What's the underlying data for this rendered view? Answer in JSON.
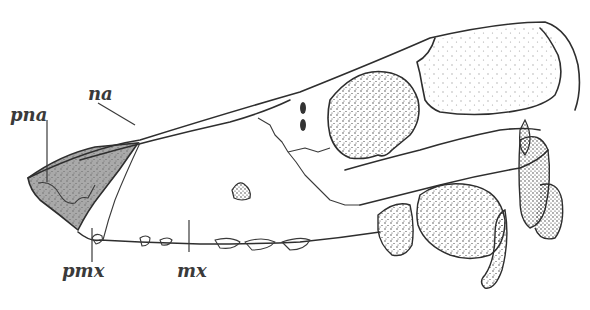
{
  "figure": {
    "labels": [
      {
        "id": "pna",
        "text": "pna",
        "x": 10,
        "y": 106
      },
      {
        "id": "na",
        "text": "na",
        "x": 88,
        "y": 85
      },
      {
        "id": "pmx",
        "text": "pmx",
        "x": 23,
        "y": 262
      },
      {
        "id": "mx",
        "text": "mx",
        "x": 177,
        "y": 262
      }
    ],
    "colors": {
      "ink": "#2e2e2e",
      "shaded_region": "#a9a9a9",
      "background": "#ffffff"
    }
  }
}
